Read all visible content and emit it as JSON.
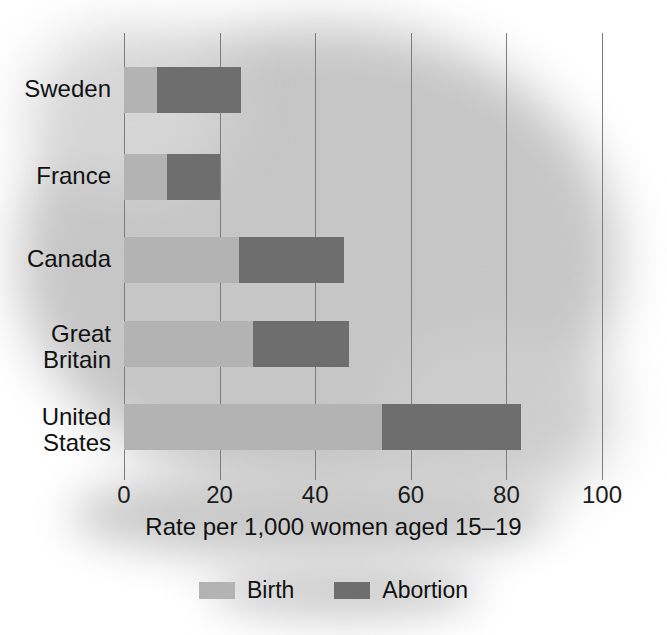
{
  "chart_data": {
    "type": "bar",
    "orientation": "horizontal",
    "stacked": true,
    "title": "",
    "xlabel": "Rate per 1,000 women aged 15–19",
    "ylabel": "",
    "xlim": [
      0,
      100
    ],
    "xticks": [
      0,
      20,
      40,
      60,
      80,
      100
    ],
    "xtick_labels": [
      "0",
      "20",
      "40",
      "60",
      "80",
      "100"
    ],
    "grid": true,
    "grid_axis": "x",
    "legend_position": "bottom",
    "categories": [
      "Sweden",
      "France",
      "Canada",
      "Great\nBritain",
      "United\nStates"
    ],
    "series": [
      {
        "name": "Birth",
        "color": "#b3b3b3",
        "values": [
          7,
          9,
          24,
          27,
          54
        ]
      },
      {
        "name": "Abortion",
        "color": "#6e6e6e",
        "values": [
          17.5,
          11,
          22,
          20,
          29
        ]
      }
    ],
    "totals": [
      24.5,
      20,
      46,
      47,
      83
    ]
  },
  "axis": {
    "title": "Rate per 1,000 women aged 15–19",
    "ticks": [
      "0",
      "20",
      "40",
      "60",
      "80",
      "100"
    ]
  },
  "categories": [
    {
      "label": "Sweden"
    },
    {
      "label": "France"
    },
    {
      "label": "Canada"
    },
    {
      "label": "Great\nBritain"
    },
    {
      "label": "United\nStates"
    }
  ],
  "legend": [
    {
      "label": "Birth",
      "color": "#b3b3b3"
    },
    {
      "label": "Abortion",
      "color": "#6e6e6e"
    }
  ]
}
